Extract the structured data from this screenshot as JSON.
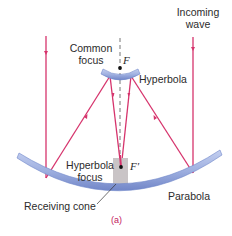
{
  "figure": {
    "caption": "(a)",
    "labels": {
      "incoming_wave_line1": "Incoming",
      "incoming_wave_line2": "wave",
      "common_focus_line1": "Common",
      "common_focus_line2": "focus",
      "focus_f": "F",
      "hyperbola": "Hyperbola",
      "hyperbola_focus_line1": "Hyperbola",
      "hyperbola_focus_line2": "focus",
      "focus_f_prime": "F′",
      "receiving_cone": "Receiving cone",
      "parabola": "Parabola"
    },
    "colors": {
      "ray": "#d6336c",
      "mirror_fill": "#9fb0e0",
      "mirror_edge": "#6f86c9",
      "cone_fill": "#c9c4c6",
      "axis": "#666666",
      "text": "#2b2b2b",
      "caption": "#c2185b"
    }
  }
}
